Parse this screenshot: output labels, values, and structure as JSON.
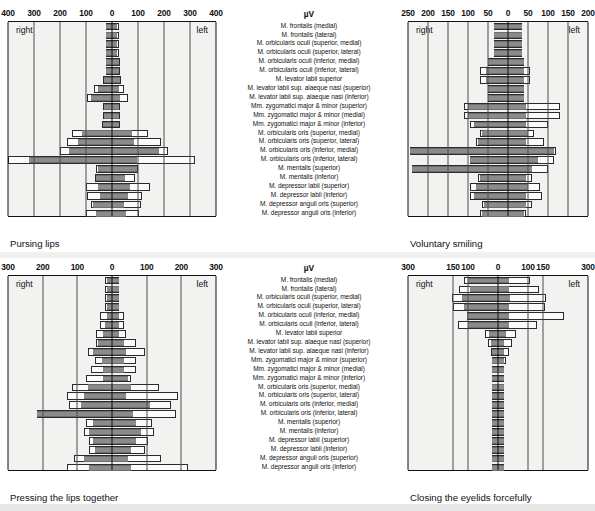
{
  "figure": {
    "unit_label": "µV",
    "side_right": "right",
    "side_left": "left"
  },
  "muscles": [
    "M. frontalis (medial)",
    "M. frontalis (lateral)",
    "M. orbicularis oculi (superior, medial)",
    "M. orbicularis oculi (superior, lateral)",
    "M. orbicularis oculi (inferior, medial)",
    "M. orbicularis oculi (inferior, lateral)",
    "M. levator labii superior",
    "M. levator labii sup. alaeque nasi (superior)",
    "M. levator labii sup. alaeque nasi (inferior)",
    "Mm. zygomatici major & minor (superior)",
    "Mm. zygomatici major & minor (medial)",
    "Mm. zygomatici major & minor (inferior)",
    "M. orbicularis oris (superior, medial)",
    "M. orbicularis oris (superior, lateral)",
    "M. orbicularis oris (inferior, medial)",
    "M. orbicularis oris (inferior, lateral)",
    "M. mentalis (superior)",
    "M. mentalis (inferior)",
    "M. depressor labii (superior)",
    "M. depressor labii (inferior)",
    "M. depressor anguli oris (superior)",
    "M. depressor anguli oris (inferior)"
  ],
  "panels": [
    {
      "id": "pursing-lips",
      "caption": "Pursing lips",
      "position": "top-left"
    },
    {
      "id": "voluntary-smiling",
      "caption": "Voluntary smiling",
      "position": "top-right"
    },
    {
      "id": "pressing-lips-together",
      "caption": "Pressing the lips together",
      "position": "bottom-left"
    },
    {
      "id": "closing-eyelids-forcefully",
      "caption": "Closing the eyelids forcefully",
      "position": "bottom-right"
    }
  ],
  "chart_data": [
    {
      "type": "bar",
      "id": "pursing-lips",
      "title": "Pursing lips",
      "orientation": "horizontal-diverging",
      "xlabel": "µV",
      "ylabel": "",
      "xlim": [
        -400,
        400
      ],
      "ticks": [
        400,
        300,
        200,
        100,
        0,
        100,
        200,
        300,
        400
      ],
      "grid": true,
      "legend": [
        "right",
        "left"
      ],
      "categories": [
        "M. frontalis (medial)",
        "M. frontalis (lateral)",
        "M. orbicularis oculi (superior, medial)",
        "M. orbicularis oculi (superior, lateral)",
        "M. orbicularis oculi (inferior, medial)",
        "M. orbicularis oculi (inferior, lateral)",
        "M. levator labii superior",
        "M. levator labii sup. alaeque nasi (superior)",
        "M. levator labii sup. alaeque nasi (inferior)",
        "Mm. zygomatici major & minor (superior)",
        "Mm. zygomatici major & minor (medial)",
        "Mm. zygomatici major & minor (inferior)",
        "M. orbicularis oris (superior, medial)",
        "M. orbicularis oris (superior, lateral)",
        "M. orbicularis oris (inferior, medial)",
        "M. orbicularis oris (inferior, lateral)",
        "M. mentalis (superior)",
        "M. mentalis (inferior)",
        "M. depressor labii (superior)",
        "M. depressor labii (inferior)",
        "M. depressor anguli oris (superior)",
        "M. depressor anguli oris (inferior)"
      ],
      "series": [
        {
          "name": "right mean",
          "values": [
            25,
            25,
            25,
            25,
            25,
            25,
            30,
            55,
            80,
            30,
            30,
            35,
            115,
            130,
            165,
            320,
            55,
            60,
            55,
            45,
            75,
            60
          ]
        },
        {
          "name": "right sd",
          "values": [
            25,
            25,
            25,
            25,
            25,
            25,
            35,
            70,
            95,
            35,
            35,
            40,
            155,
            175,
            200,
            400,
            60,
            65,
            100,
            95,
            80,
            100
          ]
        },
        {
          "name": "left mean",
          "values": [
            20,
            20,
            20,
            20,
            25,
            25,
            30,
            25,
            30,
            25,
            25,
            25,
            75,
            85,
            180,
            95,
            95,
            50,
            70,
            60,
            45,
            55
          ]
        },
        {
          "name": "left sd",
          "values": [
            25,
            25,
            25,
            25,
            30,
            30,
            35,
            45,
            60,
            30,
            30,
            30,
            140,
            190,
            215,
            320,
            100,
            90,
            145,
            115,
            110,
            105
          ]
        }
      ]
    },
    {
      "type": "bar",
      "id": "voluntary-smiling",
      "title": "Voluntary smiling",
      "orientation": "horizontal-diverging",
      "xlabel": "µV",
      "ylabel": "",
      "xlim": [
        -250,
        200
      ],
      "ticks": [
        250,
        200,
        150,
        100,
        50,
        0,
        50,
        100,
        150,
        200
      ],
      "grid": true,
      "legend": [
        "right",
        "left"
      ],
      "categories": [
        "M. frontalis (medial)",
        "M. frontalis (lateral)",
        "M. orbicularis oculi (superior, medial)",
        "M. orbicularis oculi (superior, lateral)",
        "M. orbicularis oculi (inferior, medial)",
        "M. orbicularis oculi (inferior, lateral)",
        "M. levator labii superior",
        "M. levator labii sup. alaeque nasi (superior)",
        "M. levator labii sup. alaeque nasi (inferior)",
        "Mm. zygomatici major & minor (superior)",
        "Mm. zygomatici major & minor (medial)",
        "Mm. zygomatici major & minor (inferior)",
        "M. orbicularis oris (superior, medial)",
        "M. orbicularis oris (superior, lateral)",
        "M. orbicularis oris (inferior, medial)",
        "M. orbicularis oris (inferior, lateral)",
        "M. mentalis (superior)",
        "M. mentalis (inferior)",
        "M. depressor labii (superior)",
        "M. depressor labii (inferior)",
        "M. depressor anguli oris (superior)",
        "M. depressor anguli oris (inferior)"
      ],
      "series": [
        {
          "name": "right mean",
          "values": [
            35,
            35,
            35,
            35,
            50,
            55,
            55,
            50,
            50,
            100,
            100,
            85,
            65,
            75,
            245,
            95,
            240,
            70,
            80,
            85,
            60,
            65
          ]
        },
        {
          "name": "right sd",
          "values": [
            35,
            35,
            35,
            35,
            50,
            70,
            70,
            50,
            50,
            110,
            110,
            95,
            70,
            80,
            245,
            95,
            240,
            75,
            95,
            95,
            65,
            70
          ]
        },
        {
          "name": "left mean",
          "values": [
            35,
            35,
            35,
            35,
            40,
            40,
            40,
            40,
            40,
            45,
            45,
            45,
            50,
            45,
            115,
            75,
            60,
            45,
            50,
            45,
            45,
            40
          ]
        },
        {
          "name": "left sd",
          "values": [
            35,
            35,
            35,
            35,
            40,
            55,
            55,
            40,
            40,
            130,
            130,
            100,
            65,
            90,
            120,
            115,
            100,
            60,
            80,
            85,
            60,
            45
          ]
        }
      ]
    },
    {
      "type": "bar",
      "id": "pressing-lips-together",
      "title": "Pressing the lips together",
      "orientation": "horizontal-diverging",
      "xlabel": "µV",
      "ylabel": "",
      "xlim": [
        -300,
        300
      ],
      "ticks": [
        300,
        200,
        100,
        0,
        100,
        200,
        300
      ],
      "grid": true,
      "legend": [
        "right",
        "left"
      ],
      "categories": [
        "M. frontalis (medial)",
        "M. frontalis (lateral)",
        "M. orbicularis oculi (superior, medial)",
        "M. orbicularis oculi (superior, lateral)",
        "M. orbicularis oculi (inferior, medial)",
        "M. orbicularis oculi (inferior, lateral)",
        "M. levator labii superior",
        "M. levator labii sup. alaeque nasi (superior)",
        "M. levator labii sup. alaeque nasi (inferior)",
        "Mm. zygomatici major & minor (superior)",
        "Mm. zygomatici major & minor (medial)",
        "Mm. zygomatici major & minor (inferior)",
        "M. orbicularis oris (superior, medial)",
        "M. orbicularis oris (superior, lateral)",
        "M. orbicularis oris (inferior, medial)",
        "M. orbicularis oris (inferior, lateral)",
        "M. mentalis (superior)",
        "M. mentalis (inferior)",
        "M. depressor labii (superior)",
        "M. depressor labii (inferior)",
        "M. depressor anguli oris (superior)",
        "M. depressor anguli oris (inferior)"
      ],
      "series": [
        {
          "name": "right mean",
          "values": [
            15,
            15,
            15,
            15,
            15,
            20,
            25,
            40,
            55,
            30,
            25,
            25,
            70,
            80,
            90,
            215,
            55,
            65,
            55,
            50,
            80,
            65
          ]
        },
        {
          "name": "right sd",
          "values": [
            20,
            20,
            20,
            20,
            35,
            35,
            45,
            45,
            70,
            50,
            60,
            75,
            115,
            130,
            125,
            215,
            75,
            80,
            65,
            65,
            110,
            130
          ]
        },
        {
          "name": "left mean",
          "values": [
            20,
            20,
            20,
            20,
            20,
            20,
            20,
            35,
            40,
            35,
            35,
            45,
            55,
            40,
            110,
            60,
            70,
            85,
            70,
            55,
            45,
            55
          ]
        },
        {
          "name": "left sd",
          "values": [
            20,
            20,
            20,
            20,
            35,
            35,
            40,
            70,
            95,
            70,
            70,
            55,
            135,
            190,
            170,
            185,
            115,
            120,
            105,
            95,
            140,
            220
          ]
        }
      ]
    },
    {
      "type": "bar",
      "id": "closing-eyelids-forcefully",
      "title": "Closing the eyelids forcefully",
      "orientation": "horizontal-diverging",
      "xlabel": "µV",
      "ylabel": "",
      "xlim": [
        -300,
        300
      ],
      "ticks": [
        300,
        150,
        100,
        0,
        100,
        150,
        300
      ],
      "grid": true,
      "legend": [
        "right",
        "left"
      ],
      "categories": [
        "M. frontalis (medial)",
        "M. frontalis (lateral)",
        "M. orbicularis oculi (superior, medial)",
        "M. orbicularis oculi (superior, lateral)",
        "M. orbicularis oculi (inferior, medial)",
        "M. orbicularis oculi (inferior, lateral)",
        "M. levator labii superior",
        "M. levator labii sup. alaeque nasi (superior)",
        "M. levator labii sup. alaeque nasi (inferior)",
        "Mm. zygomatici major & minor (superior)",
        "Mm. zygomatici major & minor (medial)",
        "Mm. zygomatici major & minor (inferior)",
        "M. orbicularis oris (superior, medial)",
        "M. orbicularis oris (superior, lateral)",
        "M. orbicularis oris (inferior, medial)",
        "M. orbicularis oris (inferior, lateral)",
        "M. mentalis (superior)",
        "M. mentalis (inferior)",
        "M. depressor labii (superior)",
        "M. depressor labii (inferior)",
        "M. depressor anguli oris (superior)",
        "M. depressor anguli oris (inferior)"
      ],
      "series": [
        {
          "name": "right mean",
          "values": [
            100,
            95,
            120,
            115,
            105,
            100,
            30,
            25,
            20,
            20,
            20,
            20,
            20,
            20,
            20,
            20,
            20,
            20,
            20,
            20,
            20,
            20
          ]
        },
        {
          "name": "right sd",
          "values": [
            115,
            130,
            155,
            150,
            105,
            135,
            45,
            35,
            25,
            20,
            20,
            20,
            20,
            20,
            20,
            20,
            20,
            20,
            20,
            20,
            20,
            20
          ]
        },
        {
          "name": "left mean",
          "values": [
            35,
            35,
            40,
            35,
            35,
            35,
            25,
            20,
            20,
            20,
            20,
            20,
            20,
            20,
            20,
            20,
            20,
            20,
            20,
            20,
            20,
            20
          ]
        },
        {
          "name": "left sd",
          "values": [
            105,
            135,
            160,
            155,
            220,
            130,
            60,
            45,
            35,
            25,
            20,
            20,
            20,
            20,
            20,
            20,
            20,
            20,
            20,
            20,
            20,
            20
          ]
        }
      ]
    }
  ]
}
